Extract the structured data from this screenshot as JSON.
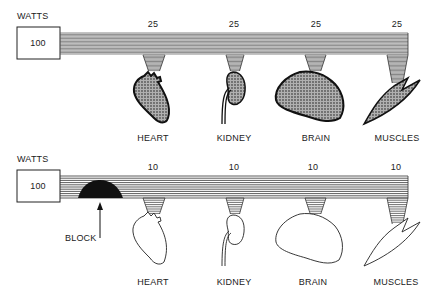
{
  "panels": [
    {
      "id": "normal",
      "units_label": "WATTS",
      "source_value": "100",
      "organs": [
        {
          "name": "HEART",
          "watts": "25"
        },
        {
          "name": "KIDNEY",
          "watts": "25"
        },
        {
          "name": "BRAIN",
          "watts": "25"
        },
        {
          "name": "MUSCLES",
          "watts": "25"
        }
      ],
      "organ_fill": "shaded"
    },
    {
      "id": "blocked",
      "units_label": "WATTS",
      "source_value": "100",
      "block_label": "BLOCK",
      "organs": [
        {
          "name": "HEART",
          "watts": "10"
        },
        {
          "name": "KIDNEY",
          "watts": "10"
        },
        {
          "name": "BRAIN",
          "watts": "10"
        },
        {
          "name": "MUSCLES",
          "watts": "10"
        }
      ],
      "organ_fill": "empty"
    }
  ],
  "colors": {
    "line": "#222222",
    "shade": "#8a8a8a",
    "block": "#111111"
  }
}
